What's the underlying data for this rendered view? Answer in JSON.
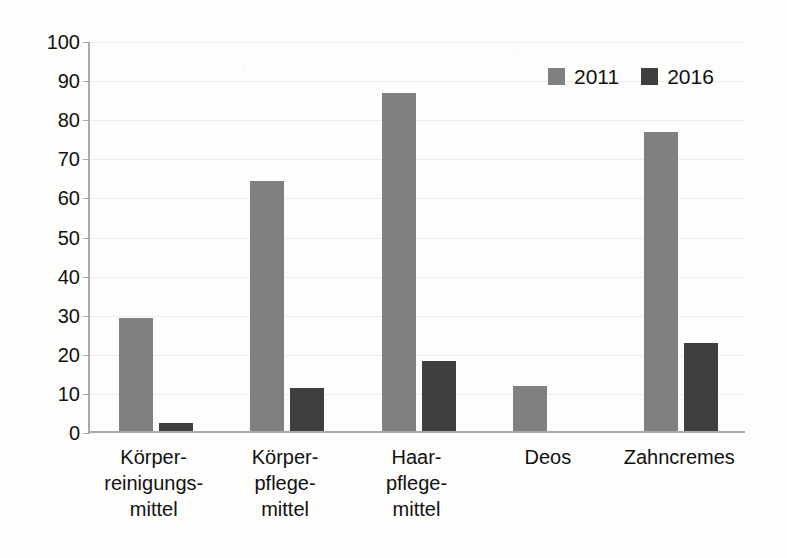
{
  "chart_data": {
    "type": "bar",
    "title": "",
    "xlabel": "",
    "ylabel": "",
    "ylim": [
      0,
      100
    ],
    "y_ticks": [
      0,
      10,
      20,
      30,
      40,
      50,
      60,
      70,
      80,
      90,
      100
    ],
    "y_tick_labels": [
      "0",
      "10",
      "20",
      "30",
      "40",
      "50",
      "60",
      "70",
      "80",
      "90",
      "100"
    ],
    "grid": true,
    "legend_position": "top-right",
    "categories": [
      "Körper-\nreinigungs-\nmittel",
      "Körper-\npflege-\nmittel",
      "Haar-\npflege-\nmittel",
      "Deos",
      "Zahncremes"
    ],
    "series": [
      {
        "name": "2011",
        "color": "#808080",
        "values": [
          29,
          64,
          86.5,
          11.5,
          76.5
        ]
      },
      {
        "name": "2016",
        "color": "#3f3f3f",
        "values": [
          2,
          11,
          18,
          0,
          22.5
        ]
      }
    ]
  },
  "legend": {
    "entries": [
      {
        "label": "2011",
        "swatch": "legend-swatch-2011"
      },
      {
        "label": "2016",
        "swatch": "legend-swatch-2016"
      }
    ]
  },
  "colors": {
    "series_2011": "#808080",
    "series_2016": "#3f3f3f",
    "axis": "#a9a9a9",
    "gridline": "#ececec",
    "background": "#fdfdfc",
    "text": "#111111"
  }
}
